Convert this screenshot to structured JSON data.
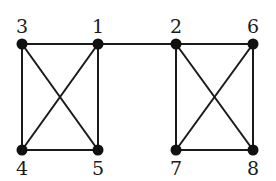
{
  "graph": {
    "nodes": [
      {
        "id": "1",
        "label": "1",
        "x": 98,
        "y": 44,
        "label_pos": "above"
      },
      {
        "id": "2",
        "label": "2",
        "x": 176,
        "y": 44,
        "label_pos": "above"
      },
      {
        "id": "3",
        "label": "3",
        "x": 22,
        "y": 44,
        "label_pos": "above"
      },
      {
        "id": "4",
        "label": "4",
        "x": 22,
        "y": 150,
        "label_pos": "below"
      },
      {
        "id": "5",
        "label": "5",
        "x": 98,
        "y": 150,
        "label_pos": "below"
      },
      {
        "id": "6",
        "label": "6",
        "x": 253,
        "y": 44,
        "label_pos": "above"
      },
      {
        "id": "7",
        "label": "7",
        "x": 176,
        "y": 150,
        "label_pos": "below"
      },
      {
        "id": "8",
        "label": "8",
        "x": 253,
        "y": 150,
        "label_pos": "below"
      }
    ],
    "edges": [
      [
        "3",
        "1"
      ],
      [
        "3",
        "4"
      ],
      [
        "3",
        "5"
      ],
      [
        "1",
        "4"
      ],
      [
        "1",
        "5"
      ],
      [
        "4",
        "5"
      ],
      [
        "1",
        "2"
      ],
      [
        "2",
        "6"
      ],
      [
        "2",
        "7"
      ],
      [
        "2",
        "8"
      ],
      [
        "6",
        "7"
      ],
      [
        "6",
        "8"
      ],
      [
        "7",
        "8"
      ]
    ],
    "colors": {
      "edge": "#1a1a1a",
      "node": "#111111",
      "background": "#ffffff"
    }
  }
}
